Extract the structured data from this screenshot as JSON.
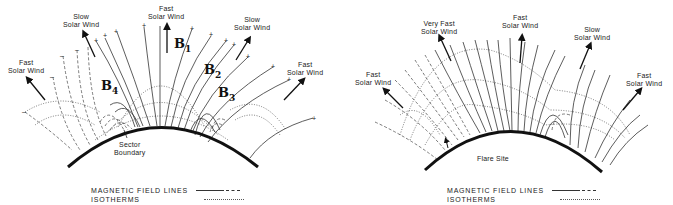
{
  "panels": [
    {
      "id": "left",
      "wind_labels": [
        {
          "line1": "Fast",
          "line2": "Solar Wind"
        },
        {
          "line1": "Slow",
          "line2": "Solar Wind"
        },
        {
          "line1": "Fast",
          "line2": "Solar Wind"
        },
        {
          "line1": "Slow",
          "line2": "Solar Wind"
        },
        {
          "line1": "Fast",
          "line2": "Solar Wind"
        }
      ],
      "field_labels": [
        "B1",
        "B2",
        "B3",
        "B4"
      ],
      "field_label_subs": [
        "1",
        "2",
        "3",
        "4"
      ],
      "surface_label": {
        "line1": "Sector",
        "line2": "Boundary"
      },
      "polarity_marks": {
        "positive": "+",
        "negative": "–"
      }
    },
    {
      "id": "right",
      "wind_labels": [
        {
          "line1": "Fast",
          "line2": "Solar Wind"
        },
        {
          "line1": "Very Fast",
          "line2": "Solar Wind"
        },
        {
          "line1": "Fast",
          "line2": "Solar Wind"
        },
        {
          "line1": "Slow",
          "line2": "Solar Wind"
        },
        {
          "line1": "Fast",
          "line2": "Solar Wind"
        }
      ],
      "surface_label": {
        "line1": "Flare Site"
      }
    }
  ],
  "legend": {
    "magnetic_field_lines": "MAGNETIC FIELD LINES",
    "isotherms": "ISOTHERMS"
  }
}
